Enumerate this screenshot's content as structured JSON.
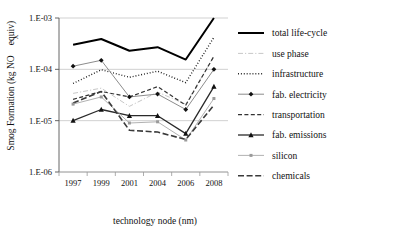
{
  "chart_data": {
    "type": "line",
    "title": "",
    "xlabel": "technology node (nm)",
    "ylabel_main": "Smog Formation (kg NO",
    "ylabel_sub": "X",
    "ylabel_tail": "equiv)",
    "ylabel_full": "Smog Formation (kg NOXequiv)",
    "x": [
      "1997",
      "1999",
      "2001",
      "2004",
      "2006",
      "2008"
    ],
    "categories": [
      "1997",
      "1999",
      "2001",
      "2004",
      "2006",
      "2008"
    ],
    "ytick_labels": [
      "1.E-03",
      "1.E-04",
      "1.E-05",
      "1.E-06"
    ],
    "ytick_values": [
      0.001,
      0.0001,
      1e-05,
      1e-06
    ],
    "ylim": [
      1e-06,
      0.001
    ],
    "yscale": "log",
    "grid": "horizontal",
    "legend_position": "right",
    "series": [
      {
        "name": "total life-cycle",
        "values": [
          0.0003,
          0.00039,
          0.00023,
          0.00027,
          0.000155,
          0.001
        ],
        "style": "solid",
        "width": 2.0,
        "color": "#000000",
        "marker": "none"
      },
      {
        "name": "use phase",
        "values": [
          3.4e-05,
          4.3e-05,
          1.9e-05,
          3.6e-05,
          2.1e-05,
          0.00018
        ],
        "style": "dashdot",
        "width": 1.0,
        "color": "#c8c8c8",
        "marker": "none"
      },
      {
        "name": "infrastructure",
        "values": [
          5.3e-05,
          9.8e-05,
          7e-05,
          9.2e-05,
          5.5e-05,
          0.00042
        ],
        "style": "dotted",
        "width": 1.4,
        "color": "#111111",
        "marker": "none"
      },
      {
        "name": "fab. electricity",
        "values": [
          0.000115,
          0.00015,
          2.9e-05,
          3.3e-05,
          1.65e-05,
          0.0001
        ],
        "style": "solid",
        "width": 1.0,
        "color": "#8c8c8c",
        "marker": "diamond"
      },
      {
        "name": "transportation",
        "values": [
          2.6e-05,
          3.7e-05,
          2.9e-05,
          4.6e-05,
          2e-05,
          0.00018
        ],
        "style": "dashed",
        "width": 1.2,
        "color": "#333333",
        "marker": "none"
      },
      {
        "name": "fab. emissions",
        "values": [
          1e-05,
          1.65e-05,
          1.25e-05,
          1.25e-05,
          5.6e-06,
          4.6e-05
        ],
        "style": "solid",
        "width": 1.3,
        "color": "#2a2a2a",
        "marker": "triangle"
      },
      {
        "name": "silicon",
        "values": [
          2.1e-05,
          2.9e-05,
          9e-06,
          9.5e-06,
          4.2e-06,
          2.7e-05
        ],
        "style": "solid",
        "width": 0.9,
        "color": "#a8a8a8",
        "marker": "dot"
      },
      {
        "name": "chemicals",
        "values": [
          2.2e-05,
          3.7e-05,
          6.5e-06,
          6e-06,
          4.3e-06,
          2e-05
        ],
        "style": "longdash",
        "width": 1.6,
        "color": "#3a3a3a",
        "marker": "none"
      }
    ]
  },
  "legend": {
    "items": [
      {
        "label": "total life-cycle"
      },
      {
        "label": "use phase"
      },
      {
        "label": "infrastructure"
      },
      {
        "label": "fab. electricity"
      },
      {
        "label": "transportation"
      },
      {
        "label": "fab. emissions"
      },
      {
        "label": "silicon"
      },
      {
        "label": "chemicals"
      }
    ]
  }
}
